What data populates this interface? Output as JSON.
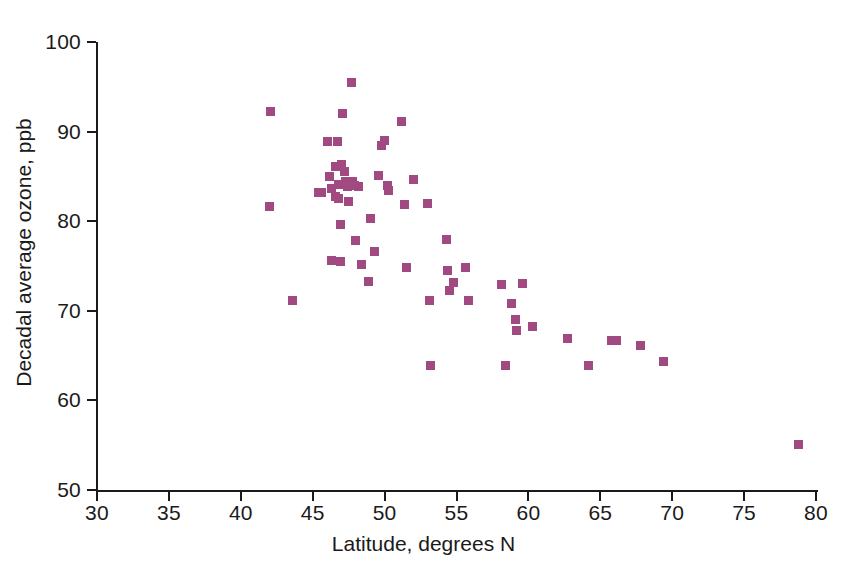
{
  "chart_data": {
    "type": "scatter",
    "title": "",
    "xlabel": "Latitude, degrees N",
    "ylabel": "Decadal average ozone, ppb",
    "xlim": [
      30,
      80
    ],
    "ylim": [
      50,
      100
    ],
    "xticks": [
      30,
      35,
      40,
      45,
      50,
      55,
      60,
      65,
      70,
      75,
      80
    ],
    "yticks": [
      50,
      60,
      70,
      80,
      90,
      100
    ],
    "grid": false,
    "legend": null,
    "series": [
      {
        "name": "Monitoring stations",
        "marker": "square",
        "color": "#a04a81",
        "points": [
          [
            42.1,
            92.2
          ],
          [
            42.0,
            81.6
          ],
          [
            43.6,
            71.1
          ],
          [
            45.4,
            83.2
          ],
          [
            45.6,
            83.2
          ],
          [
            46.0,
            88.9
          ],
          [
            46.2,
            85.0
          ],
          [
            46.3,
            83.6
          ],
          [
            46.3,
            75.6
          ],
          [
            46.6,
            86.1
          ],
          [
            46.6,
            82.8
          ],
          [
            46.7,
            88.9
          ],
          [
            46.8,
            84.1
          ],
          [
            46.8,
            82.5
          ],
          [
            46.9,
            79.6
          ],
          [
            46.9,
            75.5
          ],
          [
            47.0,
            86.3
          ],
          [
            47.1,
            92.0
          ],
          [
            47.2,
            85.6
          ],
          [
            47.3,
            84.4
          ],
          [
            47.4,
            83.9
          ],
          [
            47.5,
            82.2
          ],
          [
            47.6,
            84.2
          ],
          [
            47.7,
            95.5
          ],
          [
            47.8,
            84.4
          ],
          [
            47.9,
            84.0
          ],
          [
            48.0,
            77.8
          ],
          [
            48.2,
            83.9
          ],
          [
            48.4,
            75.2
          ],
          [
            48.9,
            73.3
          ],
          [
            49.0,
            80.3
          ],
          [
            49.3,
            76.6
          ],
          [
            49.6,
            85.1
          ],
          [
            49.8,
            88.4
          ],
          [
            50.0,
            89.0
          ],
          [
            50.2,
            84.0
          ],
          [
            50.3,
            83.4
          ],
          [
            51.2,
            91.1
          ],
          [
            51.4,
            81.9
          ],
          [
            51.5,
            74.8
          ],
          [
            52.0,
            84.6
          ],
          [
            53.0,
            82.0
          ],
          [
            53.1,
            71.2
          ],
          [
            53.2,
            63.9
          ],
          [
            54.3,
            78.0
          ],
          [
            54.4,
            74.5
          ],
          [
            54.5,
            72.3
          ],
          [
            54.8,
            73.2
          ],
          [
            55.6,
            74.8
          ],
          [
            55.8,
            71.1
          ],
          [
            58.1,
            72.9
          ],
          [
            58.4,
            63.9
          ],
          [
            58.8,
            70.8
          ],
          [
            59.1,
            69.0
          ],
          [
            59.2,
            67.8
          ],
          [
            59.6,
            73.0
          ],
          [
            60.3,
            68.2
          ],
          [
            62.7,
            66.9
          ],
          [
            64.2,
            63.9
          ],
          [
            65.8,
            66.7
          ],
          [
            66.1,
            66.7
          ],
          [
            67.8,
            66.1
          ],
          [
            69.4,
            64.3
          ],
          [
            78.8,
            55.1
          ]
        ]
      }
    ]
  },
  "style": {
    "marker_color": "#a04a81",
    "axis_color": "#1a1a1a",
    "background": "#ffffff"
  }
}
